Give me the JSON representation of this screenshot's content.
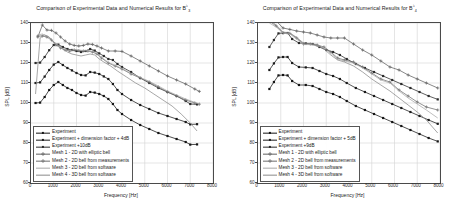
{
  "figure": {
    "background": "#ffffff",
    "axis_color": "#4a4a4a",
    "grid_color": "#d4d4d4"
  },
  "chart_data": [
    {
      "type": "line",
      "panel": "left",
      "title_prefix": "Comparison of Experimental Data and Numerical Results for B",
      "title_sup": "♭",
      "title_sub": "3",
      "title": "Comparison of Experimental Data and Numerical Results for B♭3",
      "xlabel": "Frequency [Hz]",
      "ylabel": "SPL [dB]",
      "xlim": [
        0,
        8000
      ],
      "ylim": [
        60,
        140
      ],
      "xticks": [
        0,
        1000,
        2000,
        3000,
        4000,
        5000,
        6000,
        7000,
        8000
      ],
      "yticks": [
        60,
        70,
        80,
        90,
        100,
        110,
        120,
        130,
        140
      ],
      "grid": true,
      "legend_position": "lower-left",
      "series": [
        {
          "name": "Experiment",
          "color": "#141414",
          "marker": "square",
          "x": [
            200,
            400,
            600,
            800,
            1000,
            1200,
            1400,
            1600,
            1800,
            2000,
            2200,
            2400,
            2600,
            2800,
            3000,
            3200,
            3400,
            3600,
            3800,
            4000,
            4400,
            4800,
            5200,
            5600,
            6000,
            6400,
            6800,
            7000,
            7300
          ],
          "y": [
            100.0,
            100.2,
            103.0,
            106.5,
            109.0,
            110.5,
            109.0,
            107.5,
            106.5,
            105.0,
            104.0,
            103.7,
            105.5,
            105.2,
            104.5,
            103.5,
            102.0,
            99.5,
            96.5,
            94.5,
            91.5,
            89.0,
            87.0,
            85.0,
            83.5,
            82.0,
            80.5,
            79.2,
            79.3
          ]
        },
        {
          "name": "Experiment + dimension factor + 4dB",
          "color": "#1a1a1a",
          "marker": "square",
          "x": [
            200,
            400,
            600,
            800,
            1000,
            1200,
            1400,
            1600,
            1800,
            2000,
            2200,
            2400,
            2600,
            2800,
            3000,
            3200,
            3400,
            3600,
            3800,
            4000,
            4400,
            4800,
            5200,
            5600,
            6000,
            6400,
            6800,
            7000,
            7300
          ],
          "y": [
            110.0,
            110.3,
            113.2,
            116.5,
            119.2,
            120.5,
            119.0,
            117.5,
            116.3,
            115.0,
            114.0,
            113.8,
            115.5,
            115.2,
            114.5,
            113.3,
            112.0,
            109.5,
            106.5,
            104.5,
            101.5,
            99.0,
            97.0,
            95.0,
            93.5,
            92.0,
            90.5,
            89.3,
            89.4
          ]
        },
        {
          "name": "Experiment +10dB",
          "color": "#2a2a2a",
          "marker": "square",
          "x": [
            200,
            400,
            600,
            800,
            1000,
            1200,
            1400,
            1600,
            1800,
            2000,
            2200,
            2400,
            2600,
            2800,
            3000,
            3200,
            3400,
            3600,
            3800,
            4000,
            4400,
            4800,
            5200,
            5600,
            6000,
            6400,
            6800,
            7000,
            7300
          ],
          "y": [
            120.0,
            120.2,
            123.0,
            126.4,
            129.0,
            129.2,
            128.0,
            127.0,
            126.5,
            126.0,
            125.5,
            126.0,
            127.0,
            126.2,
            124.8,
            123.5,
            122.0,
            121.5,
            119.5,
            118.0,
            115.5,
            112.5,
            110.0,
            107.5,
            105.5,
            103.5,
            101.0,
            99.5,
            99.3
          ]
        },
        {
          "name": "Mesh 1 - 2D with elliptic bell",
          "color": "#606060",
          "marker": "plus",
          "x": [
            300,
            500,
            700,
            900,
            1100,
            1300,
            1500,
            1700,
            1900,
            2100,
            2300,
            2500,
            2700,
            2900,
            3100,
            3400,
            3700,
            4000,
            4400,
            4800,
            5200,
            5600,
            6000,
            6400,
            6800,
            7200,
            7400
          ],
          "y": [
            133.0,
            139.0,
            136.5,
            136.3,
            135.0,
            133.0,
            131.0,
            129.5,
            128.8,
            128.5,
            128.8,
            129.5,
            129.3,
            128.5,
            127.5,
            126.0,
            126.0,
            125.8,
            123.5,
            121.0,
            118.5,
            116.0,
            113.5,
            111.5,
            109.5,
            107.0,
            105.8
          ]
        },
        {
          "name": "Mesh 2 - 2D bell from measurements",
          "color": "#6e6e6e",
          "marker": "plus",
          "x": [
            300,
            500,
            700,
            900,
            1100,
            1300,
            1500,
            1700,
            1900,
            2100,
            2300,
            2500,
            2700,
            2900,
            3100,
            3400,
            3700,
            4000,
            4400,
            4800,
            5200,
            5600,
            6000,
            6400,
            6800,
            7200,
            7400
          ],
          "y": [
            133.5,
            133.5,
            133.0,
            131.5,
            129.0,
            127.5,
            126.5,
            126.0,
            126.5,
            126.2,
            126.0,
            126.0,
            125.5,
            124.5,
            122.5,
            120.0,
            118.5,
            117.0,
            114.5,
            112.5,
            110.5,
            108.0,
            105.5,
            103.5,
            101.5,
            100.0,
            99.4
          ]
        },
        {
          "name": "Mesh 3 - 2D bell from software",
          "color": "#a8a8a8",
          "marker": "none",
          "x": [
            300,
            500,
            700,
            900,
            1100,
            1300,
            1500,
            1700,
            1900,
            2100,
            2300,
            2500,
            2700,
            2900,
            3100,
            3400,
            3700,
            4000,
            4400,
            4800,
            5200,
            5600,
            6000,
            6400,
            6800,
            7200,
            7400
          ],
          "y": [
            134.0,
            134.5,
            133.5,
            131.8,
            129.5,
            127.8,
            126.8,
            126.2,
            126.8,
            126.5,
            126.2,
            126.2,
            125.8,
            124.8,
            122.8,
            120.3,
            118.8,
            117.3,
            114.8,
            112.8,
            110.8,
            108.5,
            106.0,
            104.0,
            102.0,
            100.3,
            99.6
          ]
        },
        {
          "name": "Mesh 4 - 3D bell from software",
          "color": "#8a8a8a",
          "marker": "none",
          "x": [
            200,
            400,
            600,
            800,
            1000,
            1200,
            1400,
            1600,
            1800,
            2000,
            2200,
            2400,
            2600,
            2800,
            3000,
            3200,
            3500,
            3800,
            4200,
            4600,
            5000,
            5400,
            5800,
            6200,
            6600,
            7000,
            7300
          ],
          "y": [
            104.5,
            132.5,
            134.0,
            133.0,
            130.5,
            129.0,
            127.0,
            125.5,
            124.5,
            124.0,
            123.5,
            124.0,
            124.5,
            124.0,
            122.0,
            120.5,
            118.5,
            116.0,
            113.0,
            110.0,
            107.5,
            104.5,
            101.5,
            98.5,
            94.5,
            90.0,
            86.0
          ]
        }
      ]
    },
    {
      "type": "line",
      "panel": "right",
      "title_prefix": "Comparison of Experimental Data and Numerical Results for B",
      "title_sup": "♭",
      "title_sub": "4",
      "title": "Comparison of Experimental Data and Numerical Results for B♭4",
      "xlabel": "Frequency [Hz]",
      "ylabel": "SPL [dB]",
      "xlim": [
        0,
        8000
      ],
      "ylim": [
        60,
        140
      ],
      "xticks": [
        0,
        1000,
        2000,
        3000,
        4000,
        5000,
        6000,
        7000,
        8000
      ],
      "yticks": [
        60,
        70,
        80,
        90,
        100,
        110,
        120,
        130,
        140
      ],
      "grid": true,
      "legend_position": "lower-left",
      "series": [
        {
          "name": "Experiment",
          "color": "#141414",
          "marker": "square",
          "x": [
            500,
            700,
            900,
            1100,
            1300,
            1500,
            1800,
            2100,
            2400,
            2700,
            3000,
            3300,
            3600,
            3900,
            4300,
            4700,
            5100,
            5500,
            5900,
            6300,
            6700,
            7100,
            7500,
            7900
          ],
          "y": [
            107.0,
            110.5,
            113.8,
            114.0,
            113.8,
            111.0,
            109.0,
            109.0,
            108.5,
            107.0,
            105.5,
            104.5,
            103.0,
            101.0,
            98.5,
            96.5,
            94.5,
            92.5,
            90.5,
            88.5,
            86.5,
            84.5,
            82.5,
            80.8
          ]
        },
        {
          "name": "Experiment + dimension factor + 5dB",
          "color": "#1a1a1a",
          "marker": "square",
          "x": [
            500,
            700,
            900,
            1100,
            1300,
            1500,
            1800,
            2100,
            2400,
            2700,
            3000,
            3300,
            3600,
            3900,
            4300,
            4700,
            5100,
            5500,
            5900,
            6300,
            6700,
            7100,
            7500,
            7900
          ],
          "y": [
            116.5,
            119.8,
            122.8,
            123.0,
            123.0,
            120.0,
            118.0,
            117.8,
            117.5,
            116.0,
            114.5,
            113.5,
            112.0,
            110.0,
            107.5,
            105.5,
            103.5,
            101.5,
            99.5,
            97.5,
            95.5,
            93.5,
            91.5,
            89.6
          ]
        },
        {
          "name": "Experiment +9dB",
          "color": "#2a2a2a",
          "marker": "square",
          "x": [
            500,
            700,
            900,
            1100,
            1300,
            1500,
            1800,
            2100,
            2400,
            2700,
            3000,
            3300,
            3600,
            3900,
            4300,
            4700,
            5100,
            5500,
            5900,
            6300,
            6700,
            7100,
            7500,
            7900
          ],
          "y": [
            128.0,
            131.5,
            134.8,
            135.0,
            135.0,
            132.0,
            130.0,
            129.8,
            129.5,
            128.0,
            126.5,
            125.5,
            124.0,
            122.0,
            119.5,
            117.5,
            115.5,
            113.5,
            111.5,
            109.5,
            107.5,
            105.5,
            103.5,
            101.8
          ]
        },
        {
          "name": "Mesh 1 - 2D with elliptic bell",
          "color": "#606060",
          "marker": "plus",
          "x": [
            500,
            800,
            1100,
            1400,
            1700,
            2000,
            2300,
            2600,
            2900,
            3200,
            3500,
            3800,
            4200,
            4600,
            5000,
            5400,
            5800,
            6200,
            6600,
            7000,
            7400,
            7900
          ],
          "y": [
            144.5,
            141.0,
            137.5,
            136.8,
            136.0,
            135.5,
            135.0,
            134.0,
            133.0,
            132.5,
            132.5,
            132.5,
            129.5,
            126.5,
            124.0,
            121.0,
            118.0,
            116.5,
            114.0,
            112.0,
            110.0,
            107.5
          ]
        },
        {
          "name": "Mesh 2 - 2D bell from measurements",
          "color": "#6e6e6e",
          "marker": "plus",
          "x": [
            500,
            800,
            1100,
            1400,
            1700,
            2000,
            2300,
            2600,
            2900,
            3200,
            3500,
            3800,
            4200,
            4600,
            5000,
            5400,
            5800,
            6200,
            6600,
            7000,
            7400,
            7900
          ],
          "y": [
            141.0,
            138.5,
            135.0,
            134.8,
            132.5,
            129.5,
            129.5,
            129.0,
            128.0,
            125.5,
            122.5,
            121.5,
            120.5,
            118.0,
            115.0,
            112.0,
            110.5,
            106.5,
            103.5,
            100.5,
            98.0,
            96.5
          ]
        },
        {
          "name": "Mesh 3 - 2D bell from software",
          "color": "#a8a8a8",
          "marker": "none",
          "x": [
            500,
            800,
            1100,
            1400,
            1700,
            2000,
            2300,
            2600,
            2900,
            3200,
            3500,
            3800,
            4200,
            4600,
            5000,
            5400,
            5800,
            6200,
            6600,
            7000,
            7400,
            7900
          ],
          "y": [
            140.0,
            138.0,
            135.0,
            134.5,
            132.0,
            129.2,
            129.2,
            128.5,
            127.5,
            124.8,
            122.0,
            121.0,
            120.0,
            117.5,
            114.5,
            111.5,
            110.0,
            106.0,
            102.5,
            99.5,
            96.5,
            92.5
          ]
        },
        {
          "name": "Mesh 4 - 3D bell from software",
          "color": "#8a8a8a",
          "marker": "none",
          "x": [
            500,
            800,
            1100,
            1400,
            1700,
            2000,
            2300,
            2600,
            2900,
            3200,
            3500,
            3800,
            4200,
            4600,
            5000,
            5400,
            5800,
            6200,
            6600,
            7000,
            7400,
            7900
          ],
          "y": [
            141.5,
            139.0,
            135.5,
            135.0,
            132.8,
            130.0,
            129.8,
            129.2,
            127.0,
            124.0,
            121.5,
            120.5,
            118.5,
            115.5,
            112.0,
            109.0,
            106.0,
            102.5,
            99.0,
            95.5,
            91.5,
            85.0
          ]
        }
      ]
    }
  ]
}
